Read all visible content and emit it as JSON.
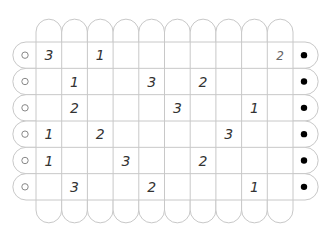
{
  "puzzle": {
    "rows": 6,
    "cols": 10,
    "grid": [
      [
        "3",
        "",
        "1",
        "",
        "",
        "",
        "",
        "",
        "",
        "2"
      ],
      [
        "",
        "1",
        "",
        "",
        "3",
        "",
        "2",
        "",
        "",
        ""
      ],
      [
        "",
        "2",
        "",
        "",
        "",
        "3",
        "",
        "",
        "1",
        ""
      ],
      [
        "1",
        "",
        "2",
        "",
        "",
        "",
        "",
        "3",
        "",
        ""
      ],
      [
        "1",
        "",
        "",
        "3",
        "",
        "",
        "2",
        "",
        "",
        ""
      ],
      [
        "",
        "3",
        "",
        "",
        "2",
        "",
        "",
        "",
        "1",
        ""
      ]
    ],
    "left_markers": [
      "open-circle",
      "open-circle",
      "open-circle",
      "open-circle",
      "open-circle",
      "open-circle"
    ],
    "right_markers": [
      "filled-dot",
      "filled-dot",
      "filled-dot",
      "filled-dot",
      "filled-dot",
      "filled-dot"
    ],
    "top_caps": 10,
    "bottom_caps": 10
  },
  "colors": {
    "grid_line": "#c8c8c8",
    "number": "#333333",
    "left_marker_stroke": "#888888",
    "right_marker_fill": "#000000",
    "background": "#ffffff"
  }
}
